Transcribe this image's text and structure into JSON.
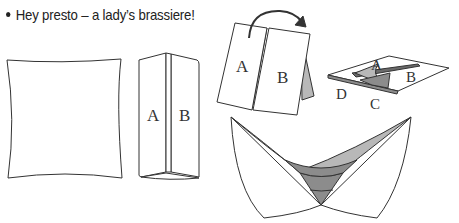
{
  "caption": "Hey presto – a lady’s brassiere!",
  "figures": {
    "step2": {
      "label_left": "A",
      "label_right": "B"
    },
    "step3": {
      "label_left": "A",
      "label_right": "B"
    },
    "step4": {
      "label_a": "A",
      "label_b": "B",
      "label_c": "C",
      "label_d": "D"
    }
  },
  "colors": {
    "stroke": "#333333",
    "shade_light": "#b8b8b8",
    "shade_mid": "#8c8c8c",
    "shade_dark": "#6a6a6a"
  }
}
